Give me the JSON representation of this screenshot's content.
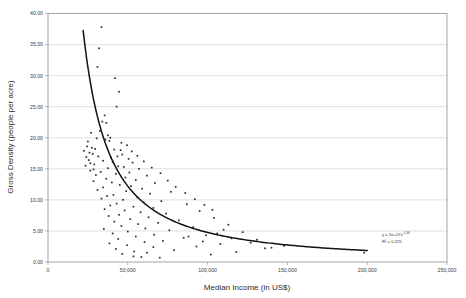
{
  "chart_data": {
    "type": "scatter",
    "title": "",
    "xlabel": "Median Income (in US$)",
    "ylabel": "Gross Density (people per acre)",
    "xlim": [
      0,
      250000
    ],
    "ylim": [
      0,
      40
    ],
    "grid": true,
    "legend": false,
    "xticks": [
      0,
      50000,
      100000,
      150000,
      200000,
      250000
    ],
    "xticklabels": [
      "0",
      "50,000",
      "100,000",
      "150,000",
      "200,000",
      "250,000"
    ],
    "yticks": [
      0,
      5,
      10,
      15,
      20,
      25,
      30,
      35,
      40
    ],
    "yticklabels": [
      "0.00",
      "5.00",
      "10.00",
      "15.00",
      "20.00",
      "25.00",
      "30.00",
      "35.00",
      "40.00"
    ],
    "annotations": {
      "equation": "y = 3e+07x",
      "equation_exponent": "-1.36",
      "r_squared": "R² = 0.225"
    },
    "trendline": {
      "type": "power",
      "coefficient": 30000000.0,
      "exponent": -1.36,
      "x_start": 22000,
      "x_end": 200000
    },
    "points": [
      [
        33500,
        37.8
      ],
      [
        32000,
        34.4
      ],
      [
        31000,
        31.4
      ],
      [
        42000,
        29.6
      ],
      [
        44500,
        27.4
      ],
      [
        43000,
        25.0
      ],
      [
        35500,
        23.6
      ],
      [
        34000,
        22.6
      ],
      [
        36500,
        22.4
      ],
      [
        32500,
        21.1
      ],
      [
        30500,
        19.9
      ],
      [
        36000,
        19.7
      ],
      [
        38500,
        19.5
      ],
      [
        24500,
        18.6
      ],
      [
        27500,
        18.4
      ],
      [
        29500,
        18.2
      ],
      [
        41500,
        18.1
      ],
      [
        45500,
        18.0
      ],
      [
        26000,
        17.6
      ],
      [
        28000,
        17.4
      ],
      [
        46500,
        17.3
      ],
      [
        43500,
        17.0
      ],
      [
        31500,
        17.0
      ],
      [
        39500,
        16.8
      ],
      [
        50500,
        16.6
      ],
      [
        25500,
        16.4
      ],
      [
        34500,
        16.3
      ],
      [
        40500,
        16.1
      ],
      [
        53000,
        16.0
      ],
      [
        29000,
        15.7
      ],
      [
        23500,
        15.5
      ],
      [
        44000,
        15.4
      ],
      [
        47500,
        15.3
      ],
      [
        37500,
        15.1
      ],
      [
        57000,
        15.0
      ],
      [
        26500,
        14.7
      ],
      [
        33000,
        14.5
      ],
      [
        51000,
        14.4
      ],
      [
        42500,
        14.2
      ],
      [
        30000,
        14.0
      ],
      [
        62000,
        13.9
      ],
      [
        48500,
        13.6
      ],
      [
        36500,
        13.4
      ],
      [
        55000,
        13.2
      ],
      [
        28500,
        13.0
      ],
      [
        40000,
        12.8
      ],
      [
        67000,
        12.7
      ],
      [
        45000,
        12.4
      ],
      [
        52000,
        12.2
      ],
      [
        34500,
        12.0
      ],
      [
        59000,
        11.8
      ],
      [
        31000,
        11.6
      ],
      [
        49000,
        11.4
      ],
      [
        77000,
        11.3
      ],
      [
        64000,
        11.0
      ],
      [
        41000,
        10.8
      ],
      [
        37000,
        10.6
      ],
      [
        56000,
        10.4
      ],
      [
        33500,
        10.2
      ],
      [
        47000,
        10.0
      ],
      [
        71000,
        9.8
      ],
      [
        60000,
        9.6
      ],
      [
        43000,
        9.4
      ],
      [
        87000,
        9.3
      ],
      [
        39000,
        9.1
      ],
      [
        53500,
        8.9
      ],
      [
        66000,
        8.7
      ],
      [
        35500,
        8.5
      ],
      [
        48000,
        8.3
      ],
      [
        95000,
        8.2
      ],
      [
        58000,
        8.0
      ],
      [
        74000,
        7.8
      ],
      [
        44500,
        7.6
      ],
      [
        38000,
        7.4
      ],
      [
        63000,
        7.2
      ],
      [
        104000,
        7.1
      ],
      [
        51500,
        6.9
      ],
      [
        82000,
        6.7
      ],
      [
        41500,
        6.5
      ],
      [
        69000,
        6.3
      ],
      [
        56500,
        6.1
      ],
      [
        113000,
        6.0
      ],
      [
        46000,
        5.8
      ],
      [
        91000,
        5.6
      ],
      [
        61000,
        5.4
      ],
      [
        35000,
        5.3
      ],
      [
        76000,
        5.1
      ],
      [
        50000,
        4.9
      ],
      [
        122000,
        4.8
      ],
      [
        40500,
        4.6
      ],
      [
        66500,
        4.4
      ],
      [
        99000,
        4.3
      ],
      [
        55000,
        4.1
      ],
      [
        85000,
        3.9
      ],
      [
        44000,
        3.7
      ],
      [
        131000,
        3.6
      ],
      [
        72000,
        3.4
      ],
      [
        60500,
        3.2
      ],
      [
        38500,
        3.0
      ],
      [
        108000,
        2.9
      ],
      [
        49500,
        2.7
      ],
      [
        93000,
        2.5
      ],
      [
        66000,
        2.4
      ],
      [
        140000,
        2.3
      ],
      [
        42500,
        2.1
      ],
      [
        79000,
        1.9
      ],
      [
        54000,
        1.7
      ],
      [
        118000,
        1.6
      ],
      [
        62000,
        1.5
      ],
      [
        46500,
        1.3
      ],
      [
        102000,
        1.2
      ],
      [
        198000,
        1.5
      ],
      [
        148000,
        2.6
      ],
      [
        127000,
        3.1
      ],
      [
        136000,
        2.2
      ],
      [
        110000,
        5.2
      ],
      [
        115000,
        3.8
      ],
      [
        106000,
        4.6
      ],
      [
        97000,
        3.3
      ],
      [
        88000,
        4.1
      ],
      [
        53500,
        0.9
      ],
      [
        58500,
        0.8
      ],
      [
        70000,
        0.7
      ],
      [
        37500,
        20.4
      ],
      [
        39000,
        20.0
      ],
      [
        46000,
        19.2
      ],
      [
        49500,
        18.8
      ],
      [
        52500,
        17.8
      ],
      [
        56000,
        17.1
      ],
      [
        60000,
        16.2
      ],
      [
        65000,
        15.2
      ],
      [
        70500,
        14.3
      ],
      [
        75000,
        13.1
      ],
      [
        80000,
        12.1
      ],
      [
        86000,
        11.1
      ],
      [
        92000,
        10.1
      ],
      [
        98000,
        9.2
      ],
      [
        103000,
        8.4
      ],
      [
        27000,
        20.8
      ],
      [
        25000,
        19.4
      ],
      [
        22500,
        17.9
      ],
      [
        24000,
        16.9
      ],
      [
        26500,
        15.9
      ],
      [
        28500,
        14.9
      ]
    ]
  }
}
